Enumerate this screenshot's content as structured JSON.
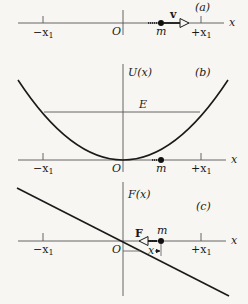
{
  "panels": {
    "a": {
      "tag": "(a)",
      "x_axis_label": "x",
      "origin_label": "O",
      "neg_tick_label": "−x",
      "neg_tick_sub": "1",
      "pos_tick_label": "+x",
      "pos_tick_sub": "1",
      "mass_label": "m",
      "vector_label": "v"
    },
    "b": {
      "tag": "(b)",
      "y_axis_label": "U(x)",
      "x_axis_label": "x",
      "energy_label": "E",
      "origin_label": "O",
      "neg_tick_label": "−x",
      "neg_tick_sub": "1",
      "pos_tick_label": "+x",
      "pos_tick_sub": "1",
      "mass_label": "m"
    },
    "c": {
      "tag": "(c)",
      "y_axis_label": "F(x)",
      "x_axis_label": "x",
      "origin_label": "O",
      "neg_tick_label": "−x",
      "neg_tick_sub": "1",
      "pos_tick_label": "+x",
      "pos_tick_sub": "1",
      "mass_label": "m",
      "force_label": "F",
      "displacement_label": "x"
    }
  },
  "colors": {
    "ink": "#1a1a1a",
    "background": "#f7f6f2"
  }
}
